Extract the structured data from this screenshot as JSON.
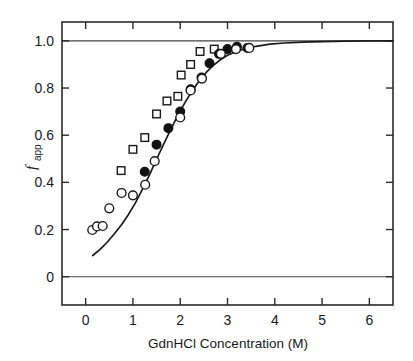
{
  "chart_data": {
    "type": "scatter",
    "title": "",
    "xlabel": "GdnHCl Concentration  (M)",
    "ylabel": "f",
    "ylabel_sub": "app",
    "xlim": [
      -0.5,
      6.5
    ],
    "ylim": [
      -0.12,
      1.08
    ],
    "xticks": [
      0,
      1,
      2,
      3,
      4,
      5,
      6
    ],
    "xtick_labels": [
      "0",
      "1",
      "2",
      "3",
      "4",
      "5",
      "6"
    ],
    "yticks": [
      0,
      0.2,
      0.4,
      0.6,
      0.8,
      1.0
    ],
    "ytick_labels": [
      "0",
      "0.2",
      "0.4",
      "0.6",
      "0.8",
      "1.0"
    ],
    "grid": false,
    "legend": "none",
    "reference_lines": [
      {
        "name": "baseline-zero",
        "y": 0
      },
      {
        "name": "baseline-one",
        "y": 1.0
      }
    ],
    "series": [
      {
        "name": "open-squares",
        "marker": "open-square",
        "points": [
          [
            0.75,
            0.45
          ],
          [
            1.0,
            0.54
          ],
          [
            1.25,
            0.59
          ],
          [
            1.5,
            0.69
          ],
          [
            1.72,
            0.745
          ],
          [
            1.95,
            0.765
          ],
          [
            2.02,
            0.855
          ],
          [
            2.22,
            0.9
          ],
          [
            2.42,
            0.955
          ],
          [
            2.72,
            0.965
          ]
        ]
      },
      {
        "name": "filled-circles",
        "marker": "filled-circle",
        "points": [
          [
            1.25,
            0.445
          ],
          [
            1.5,
            0.56
          ],
          [
            1.75,
            0.63
          ],
          [
            2.0,
            0.7
          ],
          [
            2.22,
            0.795
          ],
          [
            2.45,
            0.845
          ],
          [
            2.62,
            0.905
          ],
          [
            2.82,
            0.945
          ],
          [
            3.0,
            0.965
          ],
          [
            3.2,
            0.975
          ],
          [
            3.42,
            0.97
          ]
        ]
      },
      {
        "name": "open-circles",
        "marker": "open-circle",
        "points": [
          [
            0.14,
            0.198
          ],
          [
            0.24,
            0.213
          ],
          [
            0.36,
            0.215
          ],
          [
            0.5,
            0.29
          ],
          [
            0.76,
            0.355
          ],
          [
            1.0,
            0.345
          ],
          [
            1.26,
            0.39
          ],
          [
            1.46,
            0.49
          ],
          [
            2.0,
            0.675
          ],
          [
            2.22,
            0.79
          ],
          [
            2.46,
            0.84
          ],
          [
            2.86,
            0.945
          ],
          [
            3.18,
            0.965
          ],
          [
            3.46,
            0.97
          ]
        ]
      }
    ],
    "fit_curve": {
      "name": "sigmoidal-fit",
      "points": [
        [
          0.15,
          0.09
        ],
        [
          0.3,
          0.115
        ],
        [
          0.45,
          0.145
        ],
        [
          0.6,
          0.18
        ],
        [
          0.75,
          0.218
        ],
        [
          0.9,
          0.262
        ],
        [
          1.05,
          0.312
        ],
        [
          1.2,
          0.37
        ],
        [
          1.35,
          0.432
        ],
        [
          1.5,
          0.498
        ],
        [
          1.65,
          0.562
        ],
        [
          1.8,
          0.625
        ],
        [
          1.95,
          0.684
        ],
        [
          2.1,
          0.738
        ],
        [
          2.25,
          0.787
        ],
        [
          2.4,
          0.83
        ],
        [
          2.55,
          0.866
        ],
        [
          2.7,
          0.896
        ],
        [
          2.85,
          0.92
        ],
        [
          3.0,
          0.939
        ],
        [
          3.2,
          0.956
        ],
        [
          3.4,
          0.968
        ],
        [
          3.6,
          0.977
        ],
        [
          3.9,
          0.986
        ],
        [
          4.2,
          0.991
        ],
        [
          4.6,
          0.995
        ],
        [
          5.0,
          0.997
        ],
        [
          5.5,
          0.999
        ],
        [
          6.0,
          1.0
        ],
        [
          6.5,
          1.0
        ]
      ]
    }
  }
}
